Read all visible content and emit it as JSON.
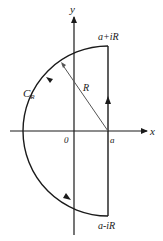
{
  "diagram": {
    "type": "contour-integral",
    "axes": {
      "x_label": "x",
      "y_label": "y",
      "origin_label": "0"
    },
    "points": {
      "center_label": "a",
      "top_label": "a+iR",
      "bottom_label": "a-iR"
    },
    "contour_label_main": "C",
    "contour_label_sub": "R",
    "radius_label": "R",
    "orientation": "counterclockwise",
    "colors": {
      "stroke": "#1a1a1a",
      "radius_line": "#555555"
    }
  }
}
